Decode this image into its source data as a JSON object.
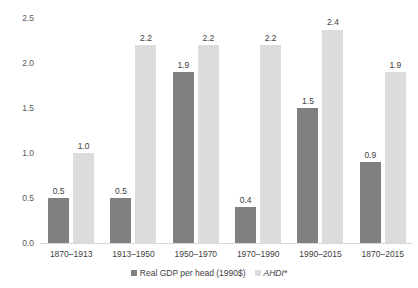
{
  "chart_data": {
    "type": "bar",
    "title": "",
    "subtitle": "",
    "xlabel": "",
    "ylabel": "",
    "ylim": [
      0.0,
      2.5
    ],
    "yticks": [
      "0.0",
      "0.5",
      "1.0",
      "1.5",
      "2.0",
      "2.5"
    ],
    "ytick_values": [
      0.0,
      0.5,
      1.0,
      1.5,
      2.0,
      2.5
    ],
    "grid": false,
    "legend_position": "bottom-center",
    "categories": [
      "1870–1913",
      "1913–1950",
      "1950–1970",
      "1970–1990",
      "1990–2015",
      "1870–2015"
    ],
    "series": [
      {
        "name": "Real GDP per head (1990$)",
        "color": "#808080",
        "italic": false,
        "values": [
          0.5,
          0.5,
          1.9,
          0.4,
          1.5,
          0.9
        ],
        "labels": [
          "0.5",
          "0.5",
          "1.9",
          "0.4",
          "1.5",
          "0.9"
        ]
      },
      {
        "name": "AHDI*",
        "color": "#dcdcdc",
        "italic": true,
        "values": [
          1.0,
          2.2,
          2.2,
          2.2,
          2.4,
          1.9
        ],
        "labels": [
          "1.0",
          "2.2",
          "2.2",
          "2.2",
          "2.4",
          "1.9"
        ]
      }
    ]
  }
}
